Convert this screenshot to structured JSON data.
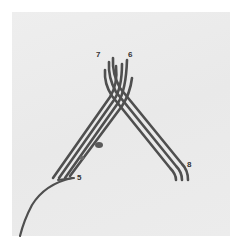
{
  "figure": {
    "labels": [
      {
        "id": "label-7",
        "text": "7"
      },
      {
        "id": "label-6",
        "text": "6"
      },
      {
        "id": "label-5",
        "text": "5"
      },
      {
        "id": "label-8",
        "text": "8"
      }
    ]
  },
  "colors": {
    "background": "#ffffff",
    "photo_background": "#ebebeb",
    "cord": "#4a4a4a",
    "label": "#333333"
  }
}
